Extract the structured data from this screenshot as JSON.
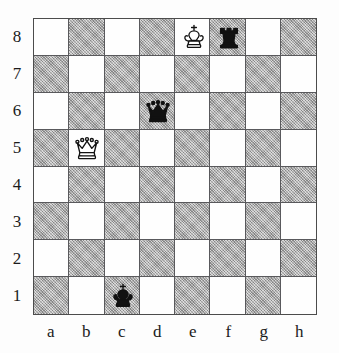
{
  "diagram": {
    "type": "chess-board-diagram",
    "orientation": "white-bottom",
    "board_size": 8,
    "colors": {
      "light_square": "#fefefe",
      "dark_square": "#a9a9a9",
      "grid_line": "#59595c",
      "border": "#4c4c4c",
      "piece_black": "#111111",
      "piece_white_outline": "#111111",
      "background": "#fdfdfd",
      "label_text": "#1b1b1b"
    }
  },
  "labels": {
    "files": [
      "a",
      "b",
      "c",
      "d",
      "e",
      "f",
      "g",
      "h"
    ],
    "ranks": [
      "8",
      "7",
      "6",
      "5",
      "4",
      "3",
      "2",
      "1"
    ]
  },
  "squares": {
    "a8_color": "light",
    "pattern": "alternating"
  },
  "pieces": [
    {
      "id": "white-king-e8",
      "icon": "white-king-icon",
      "color": "white",
      "type": "king",
      "square": "e8",
      "file": "e",
      "rank": "8",
      "file_index": 4,
      "rank_index": 0,
      "square_shade": "light"
    },
    {
      "id": "black-rook-f8",
      "icon": "black-rook-icon",
      "color": "black",
      "type": "rook",
      "square": "f8",
      "file": "f",
      "rank": "8",
      "file_index": 5,
      "rank_index": 0,
      "square_shade": "dark"
    },
    {
      "id": "black-queen-d6",
      "icon": "black-queen-icon",
      "color": "black",
      "type": "queen",
      "square": "d6",
      "file": "d",
      "rank": "6",
      "file_index": 3,
      "rank_index": 2,
      "square_shade": "dark"
    },
    {
      "id": "white-queen-b5",
      "icon": "white-queen-icon",
      "color": "white",
      "type": "queen",
      "square": "b5",
      "file": "b",
      "rank": "5",
      "file_index": 1,
      "rank_index": 3,
      "square_shade": "light"
    },
    {
      "id": "black-king-c1",
      "icon": "black-king-icon",
      "color": "black",
      "type": "king",
      "square": "c1",
      "file": "c",
      "rank": "1",
      "file_index": 2,
      "rank_index": 7,
      "square_shade": "dark"
    }
  ],
  "position": {
    "white": [
      "Ke8",
      "Qb5"
    ],
    "black": [
      "Kc1",
      "Qd6",
      "Rf8"
    ],
    "fen_board": "4kr2/8/3q4/1Q6/8/8/8/2k5"
  }
}
